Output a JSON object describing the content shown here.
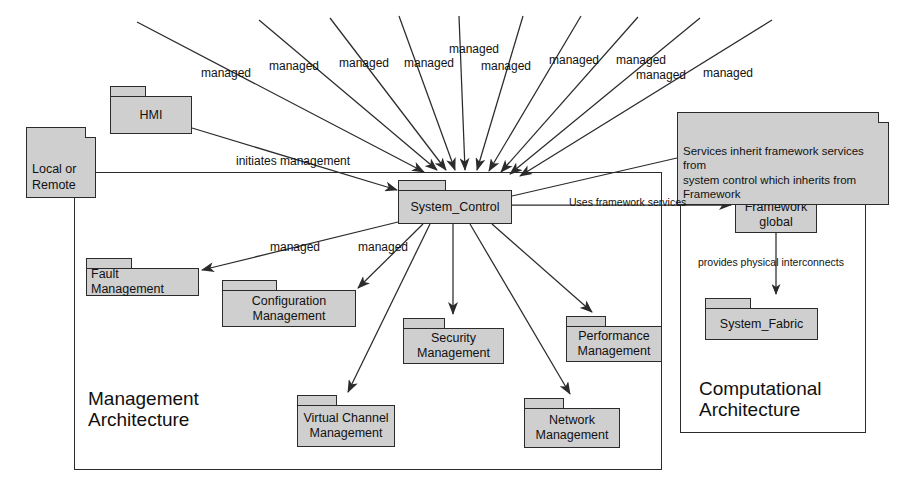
{
  "diagram": {
    "colors": {
      "package_fill": "#cfcfcf",
      "stroke": "#2b2b2b",
      "background": "#ffffff"
    }
  },
  "containers": [
    {
      "id": "management",
      "label": "Management\nArchitecture",
      "x": 74,
      "y": 172,
      "w": 588,
      "h": 298,
      "label_x": 88,
      "label_y": 388
    },
    {
      "id": "computational",
      "label": "Computational\nArchitecture",
      "x": 680,
      "y": 163,
      "w": 186,
      "h": 270,
      "label_x": 699,
      "label_y": 378
    }
  ],
  "packages": [
    {
      "id": "hmi",
      "name": "HMI",
      "x": 110,
      "y": 86,
      "w": 82,
      "h": 48,
      "tab_w": 36,
      "align": "center"
    },
    {
      "id": "system_control",
      "name": "System_Control",
      "x": 398,
      "y": 180,
      "w": 114,
      "h": 44,
      "tab_w": 48,
      "align": "center"
    },
    {
      "id": "fault",
      "name": "Fault Management",
      "x": 86,
      "y": 258,
      "w": 113,
      "h": 38,
      "tab_w": 46,
      "align": "left"
    },
    {
      "id": "configuration",
      "name": "Configuration\nManagement",
      "x": 222,
      "y": 280,
      "w": 134,
      "h": 47,
      "tab_w": 55,
      "align": "center"
    },
    {
      "id": "security",
      "name": "Security\nManagement",
      "x": 403,
      "y": 318,
      "w": 101,
      "h": 46,
      "tab_w": 42,
      "align": "center"
    },
    {
      "id": "performance",
      "name": "Performance\nManagement",
      "x": 566,
      "y": 316,
      "w": 96,
      "h": 46,
      "tab_w": 40,
      "align": "center"
    },
    {
      "id": "virtual_channel",
      "name": "Virtual Channel\nManagement",
      "x": 297,
      "y": 395,
      "w": 98,
      "h": 52,
      "tab_w": 40,
      "align": "center"
    },
    {
      "id": "network",
      "name": "Network\nManagement",
      "x": 524,
      "y": 398,
      "w": 96,
      "h": 50,
      "tab_w": 40,
      "align": "center"
    },
    {
      "id": "framework",
      "name": "Framework\nglobal",
      "x": 735,
      "y": 187,
      "w": 82,
      "h": 46,
      "tab_w": 34,
      "align": "center"
    },
    {
      "id": "system_fabric",
      "name": "System_Fabric",
      "x": 705,
      "y": 298,
      "w": 113,
      "h": 42,
      "tab_w": 46,
      "align": "center"
    }
  ],
  "notes": [
    {
      "id": "services_inherit",
      "text": "Services inherit framework services from\nsystem control which inherits from\nFramework",
      "x": 677,
      "y": 112,
      "w": 212,
      "h": 47
    },
    {
      "id": "local_or_remote",
      "text": "Local or\nRemote",
      "x": 26,
      "y": 127,
      "w": 70,
      "h": 34
    }
  ],
  "edge_labels": [
    {
      "id": "managed-1",
      "text": "managed",
      "x": 201,
      "y": 66
    },
    {
      "id": "managed-2",
      "text": "managed",
      "x": 269,
      "y": 59
    },
    {
      "id": "managed-3",
      "text": "managed",
      "x": 339,
      "y": 56
    },
    {
      "id": "managed-4",
      "text": "managed",
      "x": 404,
      "y": 56
    },
    {
      "id": "managed-5",
      "text": "managed",
      "x": 449,
      "y": 42
    },
    {
      "id": "managed-6",
      "text": "managed",
      "x": 481,
      "y": 59
    },
    {
      "id": "managed-7",
      "text": "managed",
      "x": 549,
      "y": 53
    },
    {
      "id": "managed-8",
      "text": "managed",
      "x": 616,
      "y": 53
    },
    {
      "id": "managed-9",
      "text": "managed",
      "x": 636,
      "y": 68
    },
    {
      "id": "managed-10",
      "text": "managed",
      "x": 703,
      "y": 66
    },
    {
      "id": "initiates",
      "text": "initiates management",
      "x": 236,
      "y": 154
    },
    {
      "id": "managed-cfg",
      "text": "managed",
      "x": 270,
      "y": 240
    },
    {
      "id": "managed-fm",
      "text": "managed",
      "x": 358,
      "y": 240
    },
    {
      "id": "uses_fw",
      "text": "Uses framework services",
      "x": 569,
      "y": 196
    },
    {
      "id": "provides",
      "text": "provides physical interconnects",
      "x": 698,
      "y": 256
    }
  ],
  "chart_data": {
    "type": "diagram",
    "nodes": [
      "HMI",
      "System_Control",
      "Fault Management",
      "Configuration Management",
      "Security Management",
      "Performance Management",
      "Virtual Channel Management",
      "Network Management",
      "Framework global",
      "System_Fabric"
    ],
    "edges": [
      {
        "from": "HMI",
        "to": "System_Control",
        "label": "initiates management"
      },
      {
        "from": "System_Control",
        "to": "Fault Management",
        "label": "managed"
      },
      {
        "from": "System_Control",
        "to": "Configuration Management",
        "label": "managed"
      },
      {
        "from": "System_Control",
        "to": "Security Management",
        "label": "managed"
      },
      {
        "from": "System_Control",
        "to": "Performance Management",
        "label": "managed"
      },
      {
        "from": "System_Control",
        "to": "Virtual Channel Management",
        "label": "managed"
      },
      {
        "from": "System_Control",
        "to": "Network Management",
        "label": "managed"
      },
      {
        "from": "System_Control",
        "to": "Framework global",
        "label": "Uses framework services"
      },
      {
        "from": "Framework global",
        "to": "System_Fabric",
        "label": "provides physical interconnects"
      }
    ],
    "incoming_managed_edges": 10
  }
}
